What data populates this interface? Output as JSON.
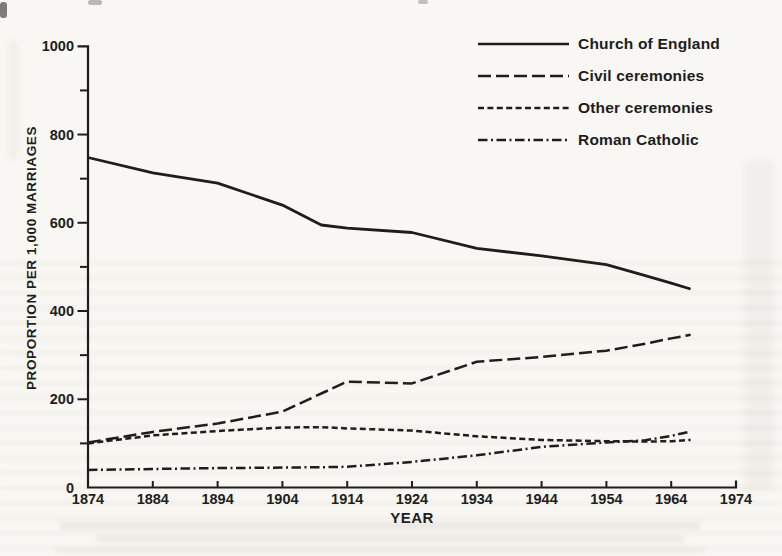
{
  "page": {
    "background_color": "#f8f7f3",
    "ink_color": "#1d1d1d"
  },
  "chart_data": {
    "type": "line",
    "title": "",
    "xlabel": "YEAR",
    "ylabel": "PROPORTION PER 1,000 MARRIAGES",
    "xlim": [
      1874,
      1974
    ],
    "ylim": [
      0,
      1000
    ],
    "x_ticks": [
      1874,
      1884,
      1894,
      1904,
      1914,
      1924,
      1934,
      1944,
      1954,
      1964,
      1974
    ],
    "y_ticks_major": [
      0,
      200,
      400,
      600,
      800,
      1000
    ],
    "y_ticks_minor": [
      100,
      300,
      500,
      700,
      900
    ],
    "grid": false,
    "legend_position": "top-right",
    "x": [
      1874,
      1884,
      1894,
      1904,
      1910,
      1914,
      1924,
      1934,
      1944,
      1954,
      1960,
      1964,
      1967
    ],
    "series": [
      {
        "name": "Church of England",
        "line_style": "solid",
        "values": [
          748,
          713,
          690,
          640,
          595,
          588,
          578,
          542,
          525,
          505,
          480,
          463,
          450
        ]
      },
      {
        "name": "Civil ceremonies",
        "line_style": "long-dash",
        "values": [
          102,
          126,
          145,
          172,
          213,
          240,
          236,
          285,
          296,
          310,
          326,
          338,
          346
        ]
      },
      {
        "name": "Other ceremonies",
        "line_style": "short-dash",
        "values": [
          100,
          118,
          128,
          136,
          137,
          134,
          129,
          116,
          108,
          105,
          104,
          105,
          108
        ]
      },
      {
        "name": "Roman Catholic",
        "line_style": "dash-dot",
        "values": [
          40,
          42,
          44,
          45,
          46,
          47,
          58,
          73,
          92,
          102,
          107,
          117,
          127
        ]
      }
    ]
  }
}
